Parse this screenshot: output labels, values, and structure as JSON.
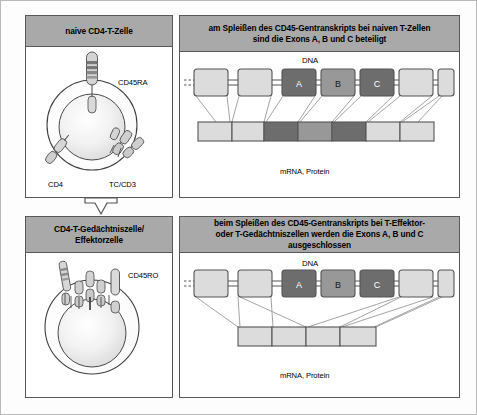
{
  "figure": {
    "title_panels": 4
  },
  "panels": {
    "naive_cell": {
      "header": "naive CD4-T-Zelle",
      "labels": {
        "cd45": "CD45RA",
        "cd4": "CD4",
        "tcr": "TC/CD3"
      }
    },
    "memory_cell": {
      "header": "CD4-T-Gedächtniszelle/ Effektorzelle",
      "header_line1": "CD4-T-Gedächtniszelle/",
      "header_line2": "Effektorzelle",
      "labels": {
        "cd45": "CD45RO"
      }
    },
    "splice_naive": {
      "header_line1": "am Spleißen des CD45-Gentranskripts bei naiven T-Zellen",
      "header_line2": "sind die Exons A, B und C beteiligt",
      "dna_label": "DNA",
      "mrna_label": "mRNA, Protein",
      "exons": [
        {
          "name": "",
          "shade": "light"
        },
        {
          "name": "",
          "shade": "light"
        },
        {
          "name": "A",
          "shade": "dark"
        },
        {
          "name": "B",
          "shade": "medium"
        },
        {
          "name": "C",
          "shade": "dark"
        },
        {
          "name": "",
          "shade": "light"
        },
        {
          "name": "",
          "shade": "light"
        }
      ],
      "mrna_segments": [
        "light",
        "light",
        "dark",
        "medium",
        "dark",
        "light",
        "light"
      ],
      "included_exons": [
        "A",
        "B",
        "C"
      ]
    },
    "splice_memory": {
      "header_line1": "beim Spleißen des CD45-Gentranskripts bei T-Effektor-",
      "header_line2": "oder T-Gedächtniszellen werden die Exons A, B und C ausgeschlossen",
      "dna_label": "DNA",
      "mrna_label": "mRNA, Protein",
      "exons": [
        {
          "name": "",
          "shade": "light"
        },
        {
          "name": "",
          "shade": "light"
        },
        {
          "name": "A",
          "shade": "dark"
        },
        {
          "name": "B",
          "shade": "medium"
        },
        {
          "name": "C",
          "shade": "dark"
        },
        {
          "name": "",
          "shade": "light"
        },
        {
          "name": "",
          "shade": "light"
        }
      ],
      "mrna_segments": [
        "light",
        "light",
        "light",
        "light"
      ],
      "excluded_exons": [
        "A",
        "B",
        "C"
      ]
    }
  },
  "colors": {
    "header_band": "#a9a9a9",
    "exon_light": "#dcdcdc",
    "exon_medium": "#989898",
    "exon_dark": "#6d6d6d",
    "outline": "#585858",
    "panel_bg": "#ffffff"
  }
}
